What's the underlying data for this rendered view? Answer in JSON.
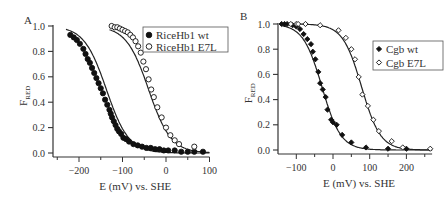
{
  "chart_data": [
    {
      "panel": "A",
      "type": "scatter",
      "title": "",
      "xlabel": "E (mV) vs. SHE",
      "ylabel": "F_RED",
      "ylabel_main": "F",
      "ylabel_sub": "RED",
      "xlim": [
        -260,
        100
      ],
      "ylim": [
        0.0,
        1.0
      ],
      "xticks": [
        -200,
        -100,
        0,
        100
      ],
      "xtick_labels": [
        "-200",
        "-100",
        "0",
        "100"
      ],
      "yticks": [
        0.0,
        0.2,
        0.4,
        0.6,
        0.8,
        1.0
      ],
      "ytick_labels": [
        "0.0",
        "0.2",
        "0.4",
        "0.6",
        "0.8",
        "1.0"
      ],
      "grid": false,
      "legend_position": "upper right",
      "series": [
        {
          "name": "RiceHb1 wt",
          "marker": "filled-circle",
          "midpoint_mV": -137,
          "x": [
            -220,
            -212,
            -205,
            -198,
            -190,
            -185,
            -180,
            -175,
            -170,
            -165,
            -160,
            -155,
            -150,
            -145,
            -140,
            -135,
            -130,
            -127,
            -124,
            -120,
            -116,
            -112,
            -108,
            -103,
            -98,
            -92,
            -85,
            -75,
            -65,
            -55,
            -45,
            -35,
            -25,
            -15,
            -5,
            5,
            20,
            35,
            50,
            65,
            85
          ],
          "y": [
            0.93,
            0.91,
            0.89,
            0.86,
            0.82,
            0.78,
            0.74,
            0.71,
            0.67,
            0.63,
            0.59,
            0.55,
            0.51,
            0.47,
            0.42,
            0.38,
            0.34,
            0.31,
            0.28,
            0.25,
            0.22,
            0.19,
            0.17,
            0.15,
            0.12,
            0.11,
            0.09,
            0.07,
            0.06,
            0.05,
            0.04,
            0.04,
            0.03,
            0.03,
            0.02,
            0.02,
            0.02,
            0.01,
            0.01,
            0.01,
            0.01
          ]
        },
        {
          "name": "RiceHb1 E7L",
          "marker": "open-circle",
          "midpoint_mV": -40,
          "x": [
            -125,
            -118,
            -112,
            -106,
            -100,
            -94,
            -88,
            -82,
            -76,
            -70,
            -64,
            -58,
            -52,
            -46,
            -40,
            -34,
            -28,
            -20,
            -10,
            0,
            10,
            20,
            30,
            65
          ],
          "y": [
            1.0,
            0.99,
            0.99,
            0.98,
            0.97,
            0.96,
            0.95,
            0.93,
            0.91,
            0.88,
            0.84,
            0.79,
            0.72,
            0.66,
            0.58,
            0.5,
            0.44,
            0.36,
            0.28,
            0.2,
            0.14,
            0.1,
            0.07,
            0.05
          ]
        }
      ]
    },
    {
      "panel": "B",
      "type": "scatter",
      "title": "",
      "xlabel": "E (mV) vs. SHE",
      "ylabel": "F_RED",
      "ylabel_main": "F",
      "ylabel_sub": "RED",
      "xlim": [
        -150,
        270
      ],
      "ylim": [
        0.0,
        1.0
      ],
      "xticks": [
        -100,
        0,
        100,
        200
      ],
      "xtick_labels": [
        "-100",
        "0",
        "100",
        "200"
      ],
      "yticks": [
        0.0,
        0.2,
        0.4,
        0.6,
        0.8,
        1.0
      ],
      "ytick_labels": [
        "0.0",
        "0.2",
        "0.4",
        "0.6",
        "0.8",
        "1.0"
      ],
      "grid": false,
      "legend_position": "right",
      "series": [
        {
          "name": "Cgb wt",
          "marker": "filled-diamond",
          "midpoint_mV": -30,
          "x": [
            -140,
            -132,
            -125,
            -110,
            -100,
            -90,
            -80,
            -70,
            -60,
            -55,
            -48,
            -40,
            -35,
            -28,
            -20,
            -15,
            -5,
            0,
            10,
            25,
            50,
            90,
            150,
            200
          ],
          "y": [
            1.0,
            1.0,
            1.0,
            0.99,
            0.98,
            0.96,
            0.92,
            0.88,
            0.84,
            0.78,
            0.72,
            0.62,
            0.53,
            0.48,
            0.42,
            0.32,
            0.24,
            0.22,
            0.2,
            0.12,
            0.06,
            0.02,
            0.01,
            0.01
          ]
        },
        {
          "name": "Cgb E7L",
          "marker": "open-diamond",
          "midpoint_mV": 78,
          "x": [
            -115,
            -100,
            -95,
            -75,
            -35,
            15,
            35,
            50,
            60,
            70,
            80,
            95,
            110,
            125,
            160,
            190,
            265
          ],
          "y": [
            1.0,
            1.0,
            1.0,
            1.0,
            0.99,
            0.95,
            0.89,
            0.8,
            0.72,
            0.58,
            0.44,
            0.35,
            0.24,
            0.15,
            0.07,
            0.02,
            0.01
          ]
        }
      ]
    }
  ],
  "panels": {
    "A": {
      "label": "A",
      "legend": [
        "RiceHb1 wt",
        "RiceHb1 E7L"
      ]
    },
    "B": {
      "label": "B",
      "legend": [
        "Cgb wt",
        "Cgb E7L"
      ]
    }
  }
}
